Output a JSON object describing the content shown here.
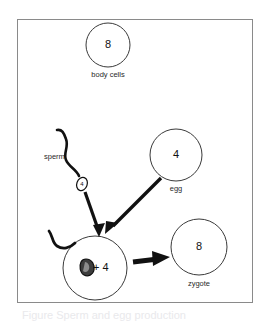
{
  "figure": {
    "caption": "Figure  Sperm and egg production",
    "frame_color": "#8a8a8a",
    "ink_color": "#111111",
    "background": "#ffffff"
  },
  "diagram": {
    "type": "biology-cell-diagram",
    "cells": [
      {
        "id": "body-cells",
        "name": "body cells",
        "value": "8",
        "label": "body cells",
        "cx": 108,
        "cy": 45,
        "r": 22
      },
      {
        "id": "egg",
        "name": "egg",
        "value": "4",
        "label": "egg",
        "cx": 176,
        "cy": 155,
        "r": 26
      },
      {
        "id": "fertilized",
        "name": "fertilized cell",
        "value": "+ 4",
        "label": "",
        "cx": 95,
        "cy": 268,
        "r": 32
      },
      {
        "id": "zygote",
        "name": "zygote",
        "value": "8",
        "label": "zygote",
        "cx": 199,
        "cy": 247,
        "r": 28
      }
    ],
    "sperm": {
      "label": "sperm",
      "head_value": "4"
    },
    "arrows": [
      {
        "id": "sperm-to-fertilized",
        "from": "sperm",
        "to": "fertilized"
      },
      {
        "id": "egg-to-fertilized",
        "from": "egg",
        "to": "fertilized"
      },
      {
        "id": "fertilized-to-zygote",
        "from": "fertilized",
        "to": "zygote"
      }
    ]
  }
}
